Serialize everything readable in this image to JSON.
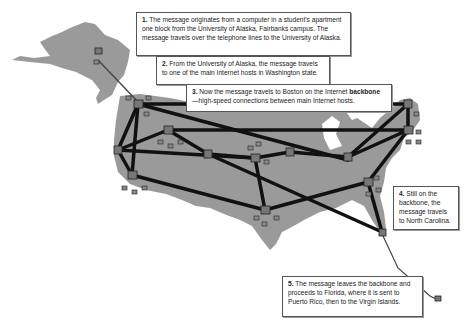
{
  "diagram": {
    "type": "network-route-map",
    "background_color": "#ffffff",
    "land_color": "#9a9a9a",
    "backbone_color": "#111111",
    "route_line_color": "#444444"
  },
  "steps": [
    {
      "number": "1.",
      "text": "The message originates from a computer in a student's apartment one block from the University of Alaska, Fairbanks campus. The message travels over the telephone lines to the University of Alaska."
    },
    {
      "number": "2.",
      "text": "From the University of Alaska, the message travels to one of the main Internet hosts in Washington state."
    },
    {
      "number": "3.",
      "text_before": "Now the message travels to Boston on the Internet ",
      "bold_term": "backbone",
      "text_after": "—high-speed connections between main Internet hosts."
    },
    {
      "number": "4.",
      "text": "Still on the backbone, the message travels to North Carolina."
    },
    {
      "number": "5.",
      "text": "The message leaves the backbone and proceeds to Florida, where it is sent to Puerto Rico, then to the Virgin Islands."
    }
  ]
}
